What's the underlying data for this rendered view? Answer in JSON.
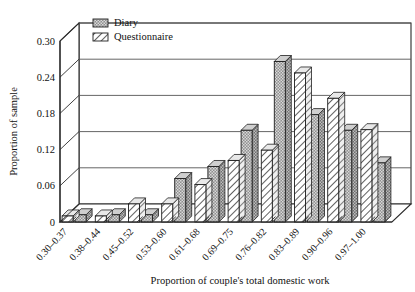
{
  "chart_data": {
    "type": "bar",
    "title": "",
    "xlabel": "Proportion of couple's total domestic work",
    "ylabel": "Proportion of sample",
    "ylim": [
      0,
      0.3
    ],
    "yticks": [
      "0",
      "0.06",
      "0.12",
      "0.18",
      "0.24",
      "0.30"
    ],
    "ytick_values": [
      0,
      0.06,
      0.12,
      0.18,
      0.24,
      0.3
    ],
    "grid": true,
    "legend_position": "top-left-inside",
    "categories": [
      "0.30–0.37",
      "0.38–0.44",
      "0.45–0.52",
      "0.53–0.60",
      "0.61–0.68",
      "0.69–0.75",
      "0.76–0.82",
      "0.83–0.89",
      "0.90–0.96",
      "0.97–1.00"
    ],
    "series": [
      {
        "name": "Questionnaire",
        "pattern": "diagonal-hatch",
        "color": "#ffffff",
        "values": [
          0.01,
          0.01,
          0.03,
          0.03,
          0.062,
          0.102,
          0.119,
          0.247,
          0.205,
          0.153
        ]
      },
      {
        "name": "Diary",
        "pattern": "stipple-dots",
        "color": "#9a9a9a",
        "values": [
          0.012,
          0.012,
          0.012,
          0.072,
          0.092,
          0.152,
          0.266,
          0.178,
          0.152,
          0.098
        ]
      }
    ]
  },
  "legend": {
    "entries": [
      {
        "label": "Diary",
        "swatch": "stipple-dots"
      },
      {
        "label": "Questionnaire",
        "swatch": "diagonal-hatch"
      }
    ]
  },
  "colors": {
    "diary_fill": "#9a9a9a",
    "questionnaire_fill": "#ffffff",
    "axis": "#2b2b2b",
    "grid": "#555555",
    "background": "#ffffff"
  }
}
